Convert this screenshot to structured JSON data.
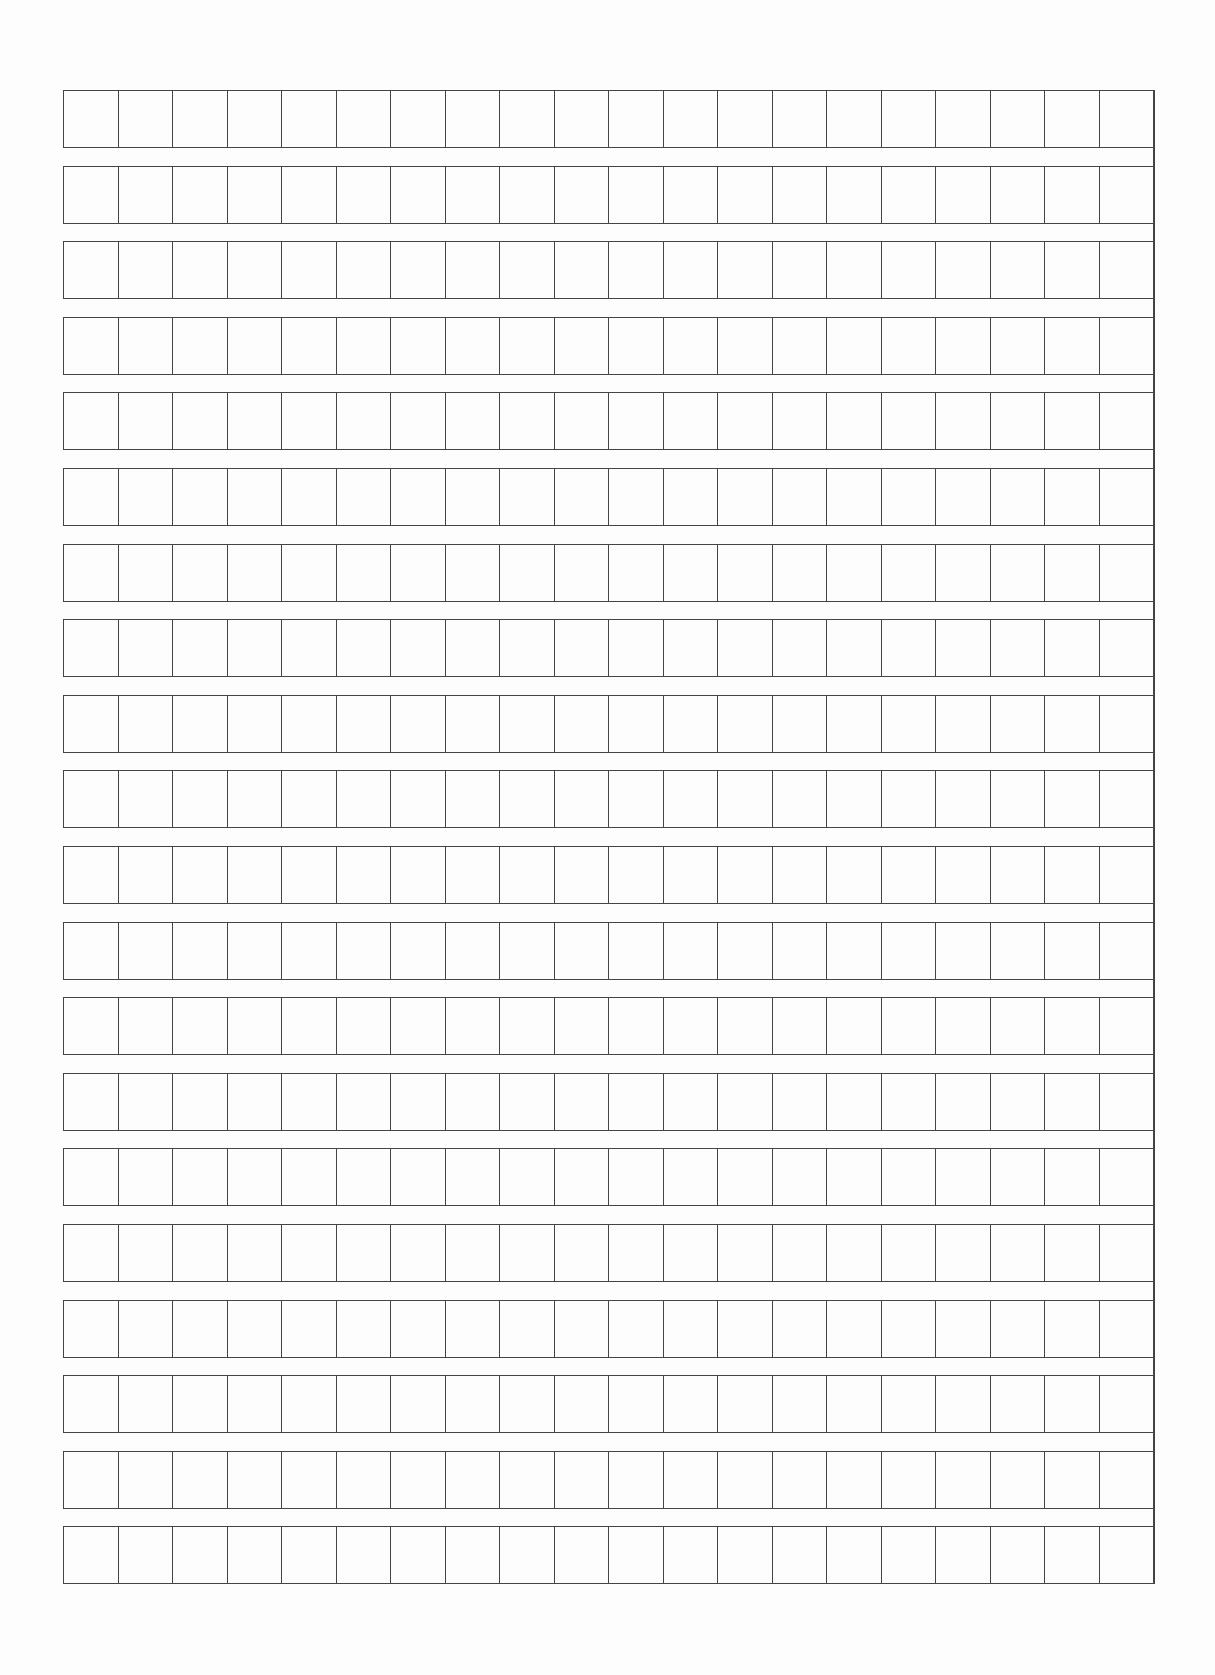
{
  "sheet": {
    "type": "writing-grid-paper",
    "rows": 20,
    "columns": 20,
    "row_height_px": 58,
    "row_pitch_px": 75.6,
    "cell_width_px": 54.5,
    "origin": {
      "x": 63,
      "y": 90
    },
    "line_color": "#444444",
    "background_color": "#fdfdfd",
    "cells_filled": 0
  }
}
